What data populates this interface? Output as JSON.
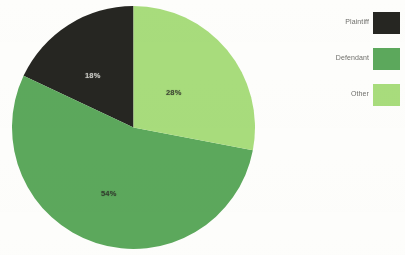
{
  "chart_data": {
    "type": "pie",
    "title": "",
    "categories": [
      "Plaintiff",
      "Defendant",
      "Other"
    ],
    "values": [
      18,
      54,
      28
    ],
    "value_labels": [
      "18%",
      "54%",
      "28%"
    ],
    "units": "percent",
    "total": 100,
    "legend_position": "right",
    "grid": false,
    "start_angle_deg": 0,
    "slices": [
      {
        "label": "Plaintiff",
        "value": 18,
        "display": "18%",
        "color": "#262622",
        "label_text_color": "#e9e9e4"
      },
      {
        "label": "Defendant",
        "value": 54,
        "display": "54%",
        "color": "#5ca85c",
        "label_text_color": "#2a2a26"
      },
      {
        "label": "Other",
        "value": 28,
        "display": "28%",
        "color": "#a8dc7c",
        "label_text_color": "#2a2a26"
      }
    ]
  },
  "legend": {
    "items": [
      {
        "label": "Plaintiff",
        "color": "#262622"
      },
      {
        "label": "Defendant",
        "color": "#5ca85c"
      },
      {
        "label": "Other",
        "color": "#a8dc7c"
      }
    ]
  },
  "colors": {
    "plaintiff": "#262622",
    "defendant": "#5ca85c",
    "other": "#a8dc7c",
    "background": "#fdfdfb"
  }
}
